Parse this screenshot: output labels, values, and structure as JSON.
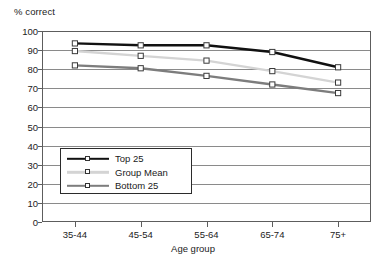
{
  "chart_data": {
    "type": "line",
    "title": "",
    "xlabel": "Age group",
    "ylabel": "% correct",
    "categories": [
      "35-44",
      "45-54",
      "55-64",
      "65-74",
      "75+"
    ],
    "ylim": [
      0,
      100
    ],
    "yticks": [
      0,
      10,
      20,
      30,
      40,
      50,
      60,
      70,
      80,
      90,
      100
    ],
    "ytick_labels": [
      "0",
      "10",
      "20",
      "30",
      "40",
      "50",
      "60",
      "70",
      "80",
      "90",
      "100"
    ],
    "grid": "horizontal",
    "legend_position": "lower-left-inside",
    "series": [
      {
        "name": "Top 25",
        "values": [
          93.5,
          92.5,
          92.5,
          89,
          81
        ],
        "color": "#111111",
        "line_width": 2.4,
        "marker": "square-open"
      },
      {
        "name": "Group Mean",
        "values": [
          89.5,
          87,
          84.5,
          79,
          73
        ],
        "color": "#d4d4d4",
        "line_width": 2.4,
        "marker": "square-open"
      },
      {
        "name": "Bottom 25",
        "values": [
          82,
          80.5,
          76.5,
          72,
          67.5
        ],
        "color": "#7d7d7d",
        "line_width": 2.4,
        "marker": "square-open"
      }
    ]
  },
  "axes": {
    "frame_color": "#5d5d5d",
    "gridline_color": "#8a8a8a",
    "background": "#ffffff"
  },
  "legend": {
    "entries": [
      "Top 25",
      "Group Mean",
      "Bottom 25"
    ]
  }
}
